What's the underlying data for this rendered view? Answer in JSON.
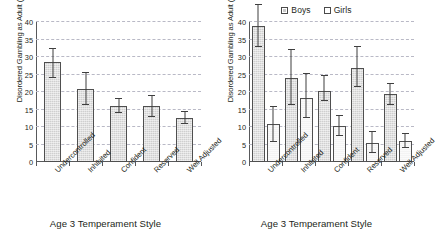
{
  "figure": {
    "panels": [
      {
        "id": "left",
        "xtitle": "Age 3 Temperament Style",
        "ylabel": "Disordered Gambling as Adult (%)",
        "legend": null
      },
      {
        "id": "right",
        "xtitle": "Age 3 Temperament Style",
        "ylabel": "Disordered Gambling as Adult (%)",
        "legend": {
          "boys": "Boys",
          "girls": "Girls"
        }
      }
    ],
    "colors": {
      "boys_fill": "#cfcfcf",
      "girls_fill": "#f4f4f4",
      "bar_outline": "#4f4f4f",
      "gridline": "#b9b9c6",
      "axis": "#58595b",
      "text": "#231f20",
      "background": "#ffffff"
    }
  },
  "chart_data": [
    {
      "type": "bar",
      "panel": "left",
      "title": "",
      "xlabel": "Age 3 Temperament Style",
      "ylabel": "Disordered Gambling as Adult (%)",
      "ylim": [
        0,
        40
      ],
      "yticks": [
        0,
        5,
        10,
        15,
        20,
        25,
        30,
        35,
        40
      ],
      "grid": true,
      "legend": null,
      "categories": [
        "Undercontrolled",
        "Inhibited",
        "Confident",
        "Reserved",
        "Well Adjusted"
      ],
      "series": [
        {
          "name": "All",
          "values": [
            28.6,
            21.0,
            16.0,
            16.0,
            12.5
          ],
          "error_low": [
            24.0,
            16.3,
            14.0,
            12.8,
            10.8
          ],
          "error_high": [
            32.2,
            25.3,
            18.0,
            19.0,
            14.4
          ]
        }
      ]
    },
    {
      "type": "bar",
      "panel": "right",
      "title": "",
      "xlabel": "Age 3 Temperament Style",
      "ylabel": "Disordered Gambling as Adult (%)",
      "ylim": [
        0,
        40
      ],
      "yticks": [
        0,
        5,
        10,
        15,
        20,
        25,
        30,
        35,
        40
      ],
      "grid": true,
      "legend": {
        "position": "top-center",
        "entries": [
          "Boys",
          "Girls"
        ]
      },
      "categories": [
        "Undercontrolled",
        "Inhibited",
        "Confident",
        "Reserved",
        "Well Adjusted"
      ],
      "series": [
        {
          "name": "Boys",
          "values": [
            39.0,
            24.0,
            20.4,
            26.8,
            19.3
          ],
          "error_low": [
            33.0,
            16.3,
            17.3,
            21.5,
            16.4
          ],
          "error_high": [
            45.0,
            32.0,
            24.5,
            32.8,
            22.4
          ]
        },
        {
          "name": "Girls",
          "values": [
            11.0,
            18.3,
            10.2,
            5.3,
            6.0
          ],
          "error_low": [
            5.8,
            12.5,
            7.5,
            2.5,
            4.0
          ],
          "error_high": [
            15.8,
            25.2,
            13.2,
            8.5,
            8.0
          ]
        }
      ]
    }
  ]
}
